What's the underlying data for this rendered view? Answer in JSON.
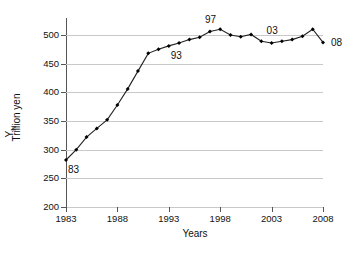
{
  "chart_data": {
    "type": "line",
    "title": "",
    "xlabel": "Years",
    "ylabel": "Trillion yen",
    "ylabel_symbol": "Y",
    "ylabel_symbol_subscript": "N",
    "xlim": [
      1983,
      2008
    ],
    "ylim": [
      200,
      520
    ],
    "yticks": [
      200,
      250,
      300,
      350,
      400,
      450,
      500
    ],
    "xticks": [
      1983,
      1988,
      1993,
      1998,
      2003,
      2008
    ],
    "grid": "horizontal",
    "legend": "none",
    "marker": "filled-diamond",
    "line_color": "#222222",
    "marker_color": "#000000",
    "grid_color": "#c9c9c9",
    "x": [
      1983,
      1984,
      1985,
      1986,
      1987,
      1988,
      1989,
      1990,
      1991,
      1992,
      1993,
      1994,
      1995,
      1996,
      1997,
      1998,
      1999,
      2000,
      2001,
      2002,
      2003,
      2004,
      2005,
      2006,
      2007,
      2008
    ],
    "values": [
      282,
      300,
      322,
      337,
      352,
      378,
      406,
      437,
      468,
      475,
      481,
      486,
      492,
      496,
      506,
      510,
      500,
      497,
      501,
      489,
      486,
      489,
      492,
      498,
      510,
      487
    ],
    "annotations": [
      {
        "label": "83",
        "x": 1983,
        "y": 282,
        "position": "below-right"
      },
      {
        "label": "93",
        "x": 1993,
        "y": 481,
        "position": "below-right"
      },
      {
        "label": "97",
        "x": 1997,
        "y": 506,
        "position": "above"
      },
      {
        "label": "03",
        "x": 2003,
        "y": 486,
        "position": "above"
      },
      {
        "label": "08",
        "x": 2008,
        "y": 487,
        "position": "right"
      }
    ]
  }
}
